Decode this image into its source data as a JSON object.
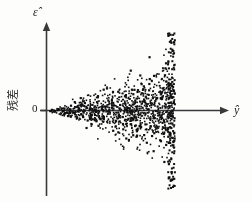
{
  "figure": {
    "title": "",
    "y_axis_label": "ε̂",
    "x_axis_label": "ŷ",
    "origin_label": "0",
    "residual_axis_text": "残差",
    "point_color": "#111111",
    "axis_color": "#3a3a3a",
    "background_color": "#fdfdfc"
  },
  "chart_data": {
    "type": "scatter",
    "title": "",
    "subtitle": "",
    "xlabel": "ŷ",
    "ylabel": "ε̂",
    "ylabel_secondary": "残差",
    "grid": false,
    "legend": "none",
    "annotations": [
      "0"
    ],
    "xlim": [
      0,
      1
    ],
    "ylim": [
      -1,
      1
    ],
    "pattern": "heteroscedastic-funnel",
    "n_points": 900,
    "x_tick_labels": [],
    "y_tick_labels": [
      "0"
    ],
    "funnel": {
      "apex_x": 0.0,
      "apex_y": 0.0,
      "max_x": 0.67,
      "half_width_at_max": 0.84,
      "spread_exponent": 1.0
    },
    "series": [
      {
        "name": "residuals",
        "marker": "square",
        "marker_size": 2,
        "color": "#111111",
        "x": [
          0.006,
          0.011,
          0.014,
          0.018,
          0.021,
          0.024,
          0.027,
          0.031,
          0.034,
          0.037,
          0.04,
          0.043,
          0.046,
          0.049,
          0.052,
          0.055,
          0.058,
          0.061,
          0.064,
          0.067,
          0.07,
          0.073,
          0.076,
          0.079,
          0.082,
          0.085,
          0.088,
          0.091,
          0.094,
          0.097,
          0.1,
          0.103,
          0.106,
          0.109,
          0.112,
          0.115,
          0.118,
          0.121,
          0.124,
          0.127,
          0.13,
          0.133,
          0.136,
          0.139,
          0.142,
          0.145,
          0.148,
          0.151,
          0.154,
          0.157,
          0.16,
          0.163,
          0.166,
          0.169,
          0.172,
          0.175,
          0.178,
          0.181,
          0.184,
          0.187,
          0.19,
          0.193,
          0.196,
          0.199,
          0.202,
          0.205,
          0.208,
          0.211,
          0.214,
          0.217,
          0.22,
          0.223,
          0.226,
          0.229,
          0.232,
          0.235,
          0.238,
          0.241,
          0.244,
          0.247,
          0.25,
          0.253,
          0.256,
          0.259,
          0.262,
          0.265,
          0.268,
          0.271,
          0.274,
          0.277,
          0.28,
          0.283,
          0.286,
          0.289,
          0.292,
          0.295,
          0.298,
          0.301,
          0.304,
          0.307,
          0.31,
          0.313,
          0.316,
          0.319,
          0.322,
          0.325,
          0.328,
          0.331,
          0.334,
          0.337,
          0.34,
          0.343,
          0.346,
          0.349,
          0.352,
          0.355,
          0.358,
          0.361,
          0.364,
          0.367,
          0.37,
          0.373,
          0.376,
          0.379,
          0.382,
          0.385,
          0.388,
          0.391,
          0.394,
          0.397,
          0.4,
          0.403,
          0.406,
          0.409,
          0.412,
          0.415,
          0.418,
          0.421,
          0.424,
          0.427,
          0.43,
          0.433,
          0.436,
          0.439,
          0.442,
          0.445,
          0.448,
          0.451,
          0.454,
          0.457,
          0.46,
          0.463,
          0.466,
          0.469,
          0.472,
          0.475,
          0.478,
          0.481,
          0.484,
          0.487,
          0.49,
          0.493,
          0.496,
          0.499,
          0.502,
          0.505,
          0.508,
          0.511,
          0.514,
          0.517,
          0.52,
          0.523,
          0.526,
          0.529,
          0.532,
          0.535,
          0.538,
          0.541,
          0.544,
          0.547,
          0.55,
          0.553,
          0.556,
          0.559,
          0.562,
          0.565,
          0.568,
          0.571,
          0.574,
          0.577,
          0.58,
          0.583,
          0.586,
          0.589,
          0.592,
          0.595,
          0.598,
          0.601,
          0.604,
          0.607,
          0.61,
          0.613,
          0.616,
          0.619,
          0.622,
          0.625,
          0.628,
          0.631,
          0.634,
          0.637,
          0.64,
          0.643,
          0.646,
          0.649,
          0.652,
          0.655,
          0.658,
          0.661,
          0.664,
          0.667
        ],
        "y_envelope": "y ~ Uniform(-1.25*x, 1.25*x)"
      }
    ]
  }
}
